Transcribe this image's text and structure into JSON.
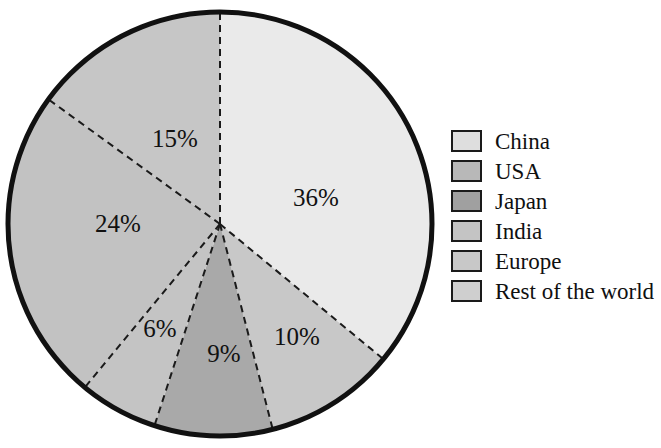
{
  "chart_data": {
    "type": "pie",
    "title": "",
    "subtitle": "",
    "xlabel": "",
    "ylabel": "",
    "unit": "%",
    "start_angle_deg": 0,
    "direction": "clockwise",
    "legend_position": "right",
    "grid": false,
    "categories": [
      "China",
      "USA",
      "Japan",
      "India",
      "Europe",
      "Rest of the world"
    ],
    "values": [
      36,
      10,
      9,
      6,
      24,
      15
    ],
    "slices": [
      {
        "label": "China",
        "value": 36,
        "data_label": "36%",
        "color": "#eaeaea",
        "label_x": 316,
        "label_y": 200
      },
      {
        "label": "USA",
        "value": 10,
        "data_label": "10%",
        "color": "#c8c8c8",
        "label_x": 297,
        "label_y": 339
      },
      {
        "label": "Japan",
        "value": 9,
        "data_label": "9%",
        "color": "#a9a9a9",
        "label_x": 224,
        "label_y": 356
      },
      {
        "label": "India",
        "value": 6,
        "data_label": "6%",
        "color": "#c4c4c4",
        "label_x": 160,
        "label_y": 331
      },
      {
        "label": "Europe",
        "value": 24,
        "data_label": "24%",
        "color": "#c2c2c2",
        "label_x": 118,
        "label_y": 226
      },
      {
        "label": "Rest of the world",
        "value": 15,
        "data_label": "15%",
        "color": "#c6c6c6",
        "label_x": 175,
        "label_y": 141
      }
    ],
    "geometry": {
      "cx": 220,
      "cy": 224,
      "r": 212
    },
    "style": {
      "outline_color": "#111111",
      "outline_width": 5,
      "divider_color": "#1a1a1a",
      "divider_width": 2,
      "divider_dash": "7 5",
      "background": "#ffffff"
    }
  },
  "legend": {
    "items": [
      {
        "label": "China",
        "color": "#dedede"
      },
      {
        "label": "USA",
        "color": "#b8b8b8"
      },
      {
        "label": "Japan",
        "color": "#a0a0a0"
      },
      {
        "label": "India",
        "color": "#c4c4c4"
      },
      {
        "label": "Europe",
        "color": "#c8c8c8"
      },
      {
        "label": "Rest of the world",
        "color": "#cfcfcf"
      }
    ]
  }
}
